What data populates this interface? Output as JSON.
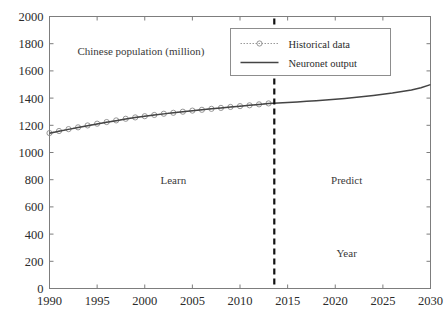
{
  "chart_data": {
    "type": "line",
    "title": "Chinese population (million)",
    "xlabel": "Year",
    "ylabel": "",
    "xlim": [
      1990,
      2030
    ],
    "ylim": [
      0,
      2000
    ],
    "xticks": [
      1990,
      1995,
      2000,
      2005,
      2010,
      2015,
      2020,
      2025,
      2030
    ],
    "yticks": [
      0,
      200,
      400,
      600,
      800,
      1000,
      1200,
      1400,
      1600,
      1800,
      2000
    ],
    "grid": false,
    "legend_position": "top-right",
    "series": [
      {
        "name": "Historical data",
        "style": "dotted-with-circle-markers",
        "color": "#9a9a9a",
        "x": [
          1990,
          1991,
          1992,
          1993,
          1994,
          1995,
          1996,
          1997,
          1998,
          1999,
          2000,
          2001,
          2002,
          2003,
          2004,
          2005,
          2006,
          2007,
          2008,
          2009,
          2010,
          2011,
          2012,
          2013
        ],
        "values": [
          1143,
          1158,
          1172,
          1185,
          1199,
          1212,
          1224,
          1236,
          1248,
          1258,
          1267,
          1276,
          1285,
          1292,
          1300,
          1308,
          1314,
          1321,
          1328,
          1335,
          1341,
          1347,
          1354,
          1361
        ]
      },
      {
        "name": "Neuronet output",
        "style": "solid",
        "color": "#444444",
        "x": [
          1990,
          1991,
          1992,
          1993,
          1994,
          1995,
          1996,
          1997,
          1998,
          1999,
          2000,
          2001,
          2002,
          2003,
          2004,
          2005,
          2006,
          2007,
          2008,
          2009,
          2010,
          2011,
          2012,
          2013,
          2014,
          2015,
          2016,
          2017,
          2018,
          2019,
          2020,
          2021,
          2022,
          2023,
          2024,
          2025,
          2026,
          2027,
          2028,
          2029,
          2030
        ],
        "values": [
          1141,
          1156,
          1170,
          1184,
          1197,
          1210,
          1222,
          1234,
          1246,
          1257,
          1266,
          1275,
          1284,
          1292,
          1300,
          1307,
          1314,
          1321,
          1328,
          1334,
          1340,
          1347,
          1353,
          1360,
          1364,
          1368,
          1372,
          1376,
          1381,
          1386,
          1391,
          1397,
          1404,
          1411,
          1419,
          1428,
          1437,
          1448,
          1460,
          1476,
          1499
        ]
      }
    ],
    "annotations": [
      {
        "name": "title-annotation",
        "text": "Chinese population (million)",
        "x": 1999.6,
        "y": 1720
      },
      {
        "name": "learn-region-label",
        "text": "Learn",
        "x": 2003.0,
        "y": 770
      },
      {
        "name": "predict-region-label",
        "text": "Predict",
        "x": 2021.2,
        "y": 770
      },
      {
        "name": "year-axis-label",
        "text": "Year",
        "x": 2021.2,
        "y": 235
      }
    ],
    "divider": {
      "name": "learn-predict-divider",
      "x": 2013.6,
      "style": "dashed",
      "color": "#111111"
    },
    "legend": {
      "entries": [
        {
          "label": "Historical data",
          "marker": "circle-dotted"
        },
        {
          "label": "Neuronet output",
          "marker": "solid-line"
        }
      ]
    }
  }
}
